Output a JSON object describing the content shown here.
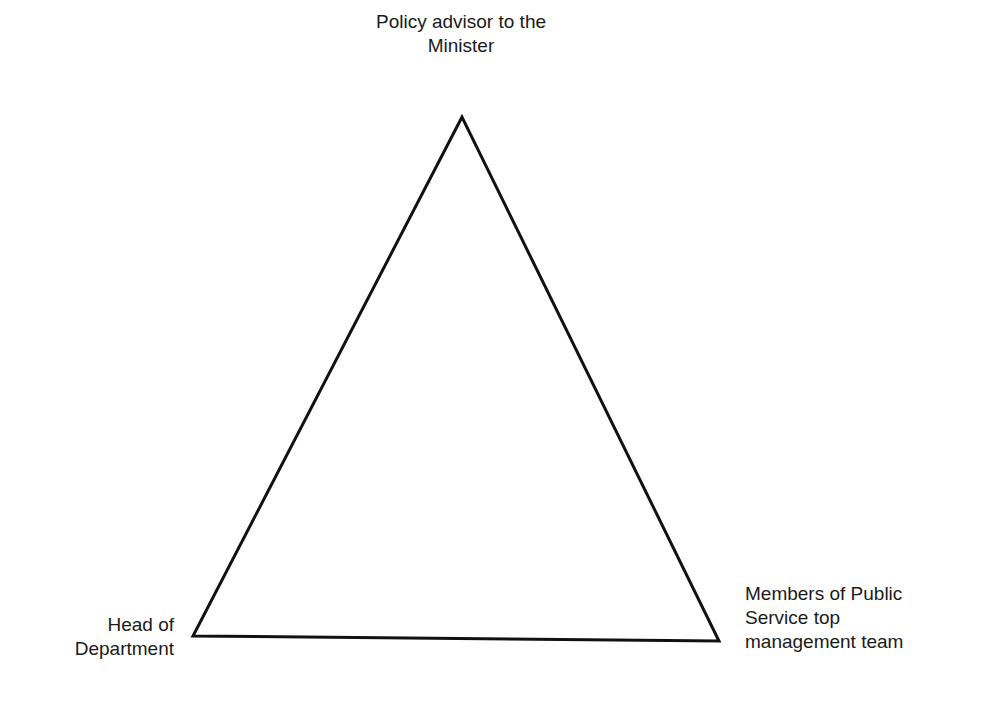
{
  "diagram": {
    "type": "triangle",
    "stroke_color": "#111111",
    "background_color": "#ffffff",
    "vertices": {
      "top": {
        "lines": [
          "Policy advisor to the",
          "Minister"
        ]
      },
      "bottom_left": {
        "lines": [
          "Head of",
          "Department"
        ]
      },
      "bottom_right": {
        "lines": [
          "Members of Public",
          "Service top",
          "management team"
        ]
      }
    }
  }
}
